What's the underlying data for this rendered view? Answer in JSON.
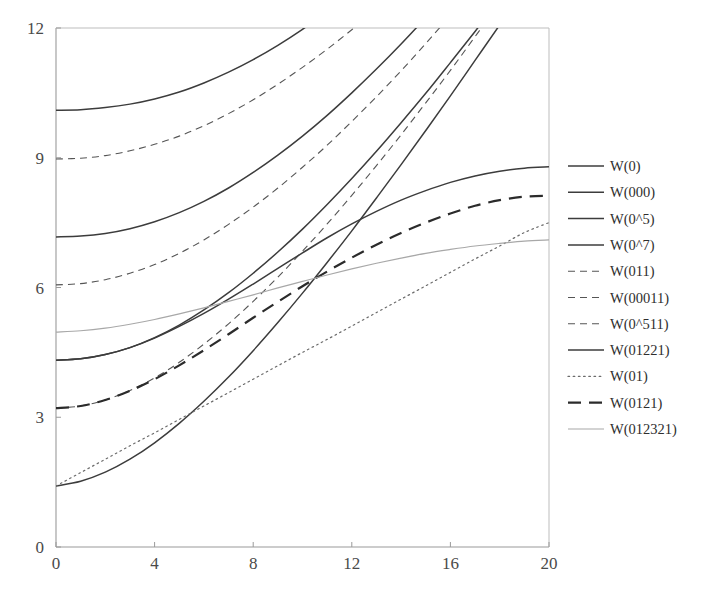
{
  "chart_data": {
    "type": "line",
    "title": "",
    "xlabel": "",
    "ylabel": "",
    "xlim": [
      0,
      20
    ],
    "ylim": [
      0,
      12
    ],
    "xticks": [
      0,
      4,
      8,
      12,
      16,
      20
    ],
    "yticks": [
      0,
      3,
      6,
      9,
      12
    ],
    "xtick_labels": [
      "0",
      "4",
      "8",
      "12",
      "16",
      "20"
    ],
    "ytick_labels": [
      "0",
      "3",
      "6",
      "9",
      "12"
    ],
    "grid": false,
    "legend_position": "right",
    "x": [
      0,
      1,
      2,
      3,
      4,
      5,
      6,
      7,
      8,
      9,
      10,
      11,
      12,
      13,
      14,
      15,
      16,
      17,
      18,
      19,
      20
    ],
    "series": [
      {
        "name": "W(0)",
        "style": "solid",
        "width": 1.5,
        "color": "#3c3c3c",
        "values": [
          1.41,
          1.52,
          1.73,
          2.03,
          2.41,
          2.86,
          3.37,
          3.93,
          4.54,
          5.19,
          5.87,
          6.58,
          7.31,
          8.07,
          8.84,
          9.63,
          10.43,
          11.25,
          12.07,
          12.9,
          13.74
        ]
      },
      {
        "name": "W(000)",
        "style": "solid",
        "width": 1.5,
        "color": "#3c3c3c",
        "values": [
          4.32,
          4.35,
          4.45,
          4.61,
          4.84,
          5.13,
          5.48,
          5.88,
          6.33,
          6.82,
          7.35,
          7.92,
          8.52,
          9.15,
          9.81,
          10.49,
          11.2,
          11.92,
          12.66,
          13.42,
          14.2
        ]
      },
      {
        "name": "W(0^5)",
        "style": "solid",
        "width": 1.5,
        "color": "#3c3c3c",
        "values": [
          7.17,
          7.19,
          7.25,
          7.36,
          7.52,
          7.73,
          7.99,
          8.3,
          8.66,
          9.06,
          9.5,
          9.98,
          10.5,
          11.05,
          11.63,
          12.24,
          12.87,
          13.53,
          14.2,
          14.9,
          15.61
        ]
      },
      {
        "name": "W(0^7)",
        "style": "solid",
        "width": 1.5,
        "color": "#3c3c3c",
        "values": [
          10.1,
          10.11,
          10.16,
          10.24,
          10.36,
          10.52,
          10.73,
          10.98,
          11.27,
          11.6,
          11.97,
          12.38,
          12.83,
          13.31,
          13.82,
          14.36,
          14.93,
          15.52,
          16.14,
          16.78,
          17.44
        ]
      },
      {
        "name": "W(011)",
        "style": "dashed-fine",
        "width": 1.1,
        "color": "#555555",
        "values": [
          3.21,
          3.26,
          3.4,
          3.62,
          3.91,
          4.27,
          4.69,
          5.16,
          5.68,
          6.24,
          6.84,
          7.47,
          8.13,
          8.82,
          9.53,
          10.27,
          11.02,
          11.8,
          12.59,
          13.4,
          14.22
        ]
      },
      {
        "name": "W(00011)",
        "style": "dashed-fine",
        "width": 1.1,
        "color": "#555555",
        "values": [
          6.06,
          6.09,
          6.18,
          6.33,
          6.53,
          6.79,
          7.1,
          7.46,
          7.86,
          8.3,
          8.78,
          9.29,
          9.84,
          10.41,
          11.01,
          11.64,
          12.29,
          12.96,
          13.65,
          14.36,
          15.08
        ]
      },
      {
        "name": "W(0^511)",
        "style": "dashed-fine",
        "width": 1.1,
        "color": "#555555",
        "values": [
          8.97,
          8.99,
          9.05,
          9.16,
          9.31,
          9.5,
          9.74,
          10.02,
          10.34,
          10.7,
          11.09,
          11.51,
          11.96,
          12.44,
          12.95,
          13.48,
          14.04,
          14.61,
          15.21,
          15.82,
          16.45
        ]
      },
      {
        "name": "W(01221)",
        "style": "solid",
        "width": 1.5,
        "color": "#3c3c3c",
        "values": [
          4.32,
          4.35,
          4.45,
          4.61,
          4.83,
          5.1,
          5.4,
          5.73,
          6.08,
          6.44,
          6.8,
          7.15,
          7.47,
          7.76,
          8.02,
          8.24,
          8.43,
          8.58,
          8.69,
          8.76,
          8.79
        ]
      },
      {
        "name": "W(01)",
        "style": "dotted",
        "width": 1.2,
        "color": "#6b6b6b",
        "values": [
          1.41,
          1.72,
          2.03,
          2.34,
          2.64,
          2.95,
          3.26,
          3.57,
          3.88,
          4.19,
          4.5,
          4.8,
          5.11,
          5.42,
          5.73,
          6.04,
          6.35,
          6.66,
          6.96,
          7.27,
          7.5
        ]
      },
      {
        "name": "W(0121)",
        "style": "dashed-bold",
        "width": 2.2,
        "color": "#2b2b2b",
        "values": [
          3.21,
          3.26,
          3.4,
          3.61,
          3.88,
          4.2,
          4.55,
          4.92,
          5.3,
          5.67,
          6.03,
          6.37,
          6.69,
          6.99,
          7.26,
          7.5,
          7.71,
          7.89,
          8.02,
          8.1,
          8.12
        ]
      },
      {
        "name": "W(012321)",
        "style": "solid",
        "width": 1.2,
        "color": "#a8a8a8",
        "values": [
          4.97,
          5.0,
          5.06,
          5.15,
          5.26,
          5.39,
          5.53,
          5.68,
          5.83,
          5.99,
          6.14,
          6.29,
          6.43,
          6.56,
          6.68,
          6.79,
          6.88,
          6.96,
          7.02,
          7.07,
          7.1
        ]
      }
    ]
  },
  "legend": {
    "entries": [
      {
        "label": "W(0)"
      },
      {
        "label": "W(000)"
      },
      {
        "label": "W(0^5)"
      },
      {
        "label": "W(0^7)"
      },
      {
        "label": "W(011)"
      },
      {
        "label": "W(00011)"
      },
      {
        "label": "W(0^511)"
      },
      {
        "label": "W(01221)"
      },
      {
        "label": "W(01)"
      },
      {
        "label": "W(0121)"
      },
      {
        "label": "W(012321)"
      }
    ]
  },
  "colors": {
    "axis": "#9a9a9a",
    "tick_text": "#4a4a4a",
    "solid_dark": "#3c3c3c",
    "dashed_mid": "#555555",
    "dotted_light": "#6b6b6b",
    "gray_line": "#a8a8a8",
    "background": "#ffffff"
  }
}
